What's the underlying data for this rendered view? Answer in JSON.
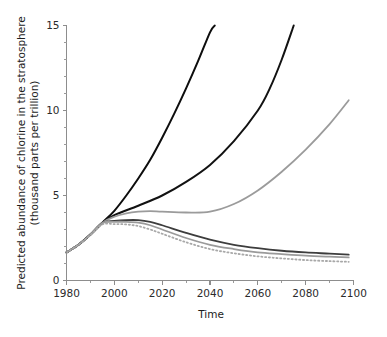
{
  "chart_data": {
    "type": "line",
    "title": "",
    "subtitle": "",
    "xlabel": "Time",
    "ylabel_line1": "Predicted abundance of chlorine in the stratosphere",
    "ylabel_line2": "(thousand parts per trillion)",
    "xlim": [
      1980,
      2100
    ],
    "ylim": [
      0,
      15
    ],
    "x_major_ticks": [
      1980,
      2000,
      2020,
      2040,
      2060,
      2080,
      2100
    ],
    "x_tick_labels": [
      "1980",
      "2000",
      "2020",
      "2040",
      "2060",
      "2080",
      "2100"
    ],
    "x_minor_ticks": [
      1990,
      2010,
      2030,
      2050,
      2070,
      2090
    ],
    "y_major_ticks": [
      0,
      5,
      10,
      15
    ],
    "y_tick_labels": [
      "0",
      "5",
      "10",
      "15"
    ],
    "y_minor_ticks": [
      1,
      2,
      3,
      4,
      6,
      7,
      8,
      9,
      11,
      12,
      13,
      14
    ],
    "grid": false,
    "legend": "none",
    "series": [
      {
        "name": "no-protocol-highest",
        "color": "#0d0d0d",
        "width": 2.0,
        "dash": "none",
        "x": [
          1980,
          1985,
          1990,
          1995,
          2000,
          2005,
          2010,
          2015,
          2020,
          2025,
          2030,
          2035,
          2040,
          2042
        ],
        "values": [
          1.65,
          2.1,
          2.7,
          3.4,
          4.1,
          5.0,
          6.0,
          7.1,
          8.4,
          9.8,
          11.3,
          12.9,
          14.6,
          15.0
        ]
      },
      {
        "name": "no-protocol-second",
        "color": "#121212",
        "width": 2.0,
        "dash": "none",
        "x": [
          1980,
          1985,
          1990,
          1995,
          2000,
          2010,
          2020,
          2030,
          2040,
          2050,
          2060,
          2065,
          2070,
          2075
        ],
        "values": [
          1.65,
          2.1,
          2.7,
          3.4,
          3.85,
          4.4,
          5.0,
          5.8,
          6.8,
          8.2,
          10.0,
          11.3,
          13.0,
          15.0
        ]
      },
      {
        "name": "partial-control-rising",
        "color": "#9b9b9b",
        "width": 1.8,
        "dash": "none",
        "x": [
          1980,
          1985,
          1990,
          1995,
          2000,
          2005,
          2010,
          2015,
          2020,
          2030,
          2040,
          2050,
          2060,
          2070,
          2080,
          2090,
          2098
        ],
        "values": [
          1.65,
          2.1,
          2.7,
          3.4,
          3.75,
          3.95,
          4.05,
          4.08,
          4.05,
          4.0,
          4.05,
          4.5,
          5.3,
          6.4,
          7.7,
          9.2,
          10.6
        ]
      },
      {
        "name": "protocol-dark-gray",
        "color": "#3d3d3d",
        "width": 1.8,
        "dash": "none",
        "x": [
          1980,
          1985,
          1990,
          1995,
          2000,
          2005,
          2010,
          2015,
          2020,
          2030,
          2040,
          2050,
          2060,
          2070,
          2080,
          2090,
          2098
        ],
        "values": [
          1.65,
          2.1,
          2.7,
          3.4,
          3.5,
          3.55,
          3.55,
          3.45,
          3.25,
          2.8,
          2.4,
          2.1,
          1.9,
          1.75,
          1.65,
          1.58,
          1.52
        ]
      },
      {
        "name": "protocol-mid-gray",
        "color": "#9a9a9a",
        "width": 1.8,
        "dash": "none",
        "x": [
          1980,
          1985,
          1990,
          1995,
          2000,
          2005,
          2010,
          2015,
          2020,
          2030,
          2040,
          2050,
          2060,
          2070,
          2080,
          2090,
          2098
        ],
        "values": [
          1.65,
          2.1,
          2.7,
          3.38,
          3.45,
          3.45,
          3.4,
          3.25,
          3.0,
          2.5,
          2.1,
          1.85,
          1.65,
          1.55,
          1.46,
          1.4,
          1.36
        ]
      },
      {
        "name": "protocol-dotted-light-gray",
        "color": "#a8a8a8",
        "width": 1.8,
        "dash": "1.2 2.6",
        "x": [
          1980,
          1985,
          1990,
          1995,
          2000,
          2005,
          2010,
          2015,
          2020,
          2030,
          2040,
          2050,
          2060,
          2070,
          2080,
          2090,
          2098
        ],
        "values": [
          1.65,
          2.1,
          2.68,
          3.3,
          3.32,
          3.3,
          3.2,
          3.0,
          2.75,
          2.25,
          1.85,
          1.6,
          1.42,
          1.3,
          1.2,
          1.14,
          1.1
        ]
      }
    ]
  },
  "axis_colors": {
    "axis_line": "#8d8d8d",
    "tick_text": "#2b2b2b",
    "background": "#ffffff"
  }
}
